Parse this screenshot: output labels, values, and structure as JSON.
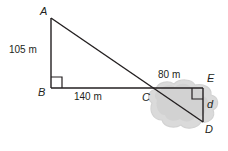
{
  "figure": {
    "background_color": "#ffffff",
    "stroke_color": "#231f20",
    "bush_fill_color": "#d9d9d9",
    "bush_edge_color": "#cfcfcf",
    "vertices": {
      "A": {
        "label": "A",
        "x": 51,
        "y": 18
      },
      "B": {
        "label": "B",
        "x": 51,
        "y": 88
      },
      "C": {
        "label": "C",
        "x": 146,
        "y": 88
      },
      "D": {
        "label": "D",
        "x": 203,
        "y": 122
      },
      "E": {
        "label": "E",
        "x": 203,
        "y": 88
      }
    },
    "measurements": {
      "ab": "105 m",
      "bc": "140 m",
      "ce": "80 m",
      "ed": "d"
    },
    "right_angles": [
      {
        "at": "B",
        "name": "right-angle-marker-b"
      },
      {
        "at": "E",
        "name": "right-angle-marker-e"
      }
    ]
  }
}
